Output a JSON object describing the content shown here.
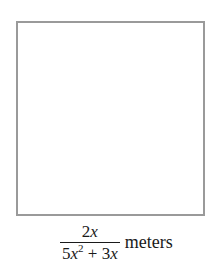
{
  "figure": {
    "shape": "square",
    "side_label": {
      "numerator": {
        "coef": "2",
        "var": "x"
      },
      "denominator": {
        "term1_coef": "5",
        "term1_var": "x",
        "term1_exp": "2",
        "operator": " + ",
        "term2_coef": "3",
        "term2_var": "x"
      },
      "unit": "meters"
    }
  }
}
